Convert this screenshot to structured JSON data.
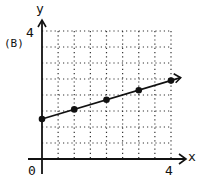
{
  "panel_label": "(B)",
  "axis": {
    "x_label": "x",
    "y_label": "y",
    "origin_label": "0",
    "x_max_label": "4",
    "y_max_label": "4"
  },
  "colors": {
    "ink": "#111111",
    "grid": "#333333"
  },
  "chart_data": {
    "type": "line",
    "title": "(B)",
    "xlabel": "x",
    "ylabel": "y",
    "xlim": [
      0,
      4
    ],
    "ylim": [
      0,
      4
    ],
    "grid": true,
    "grid_step": 0.5,
    "x": [
      0,
      1,
      2,
      3,
      4
    ],
    "series": [
      {
        "name": "line",
        "values": [
          1.25,
          1.55,
          1.85,
          2.15,
          2.45
        ],
        "markers": true,
        "arrow_end": true
      }
    ]
  }
}
